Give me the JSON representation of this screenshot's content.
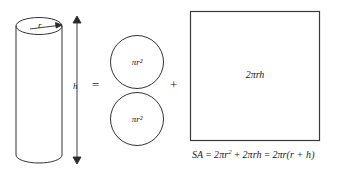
{
  "figure": {
    "caption_formula": "SA = 2πr² + 2πrh = 2πr(r + h)"
  },
  "cylinder": {
    "radius_label": "r",
    "height_label": "h"
  },
  "operators": {
    "equals": "=",
    "plus": "+"
  },
  "pieces": {
    "top_circle_label": "πr²",
    "bottom_circle_label": "πr²",
    "rectangle_label": "2πrh"
  },
  "formula": {
    "lhs": "SA",
    "eq1": "=",
    "term1_coef": "2πr",
    "term1_exp": "2",
    "plus": "+",
    "term2": "2πrh",
    "eq2": "=",
    "term3": "2πr(r + h)"
  },
  "colors": {
    "stroke": "#333333",
    "text": "#1b1b1b",
    "background": "#ffffff",
    "rect_stroke": "#3a3a3a"
  }
}
